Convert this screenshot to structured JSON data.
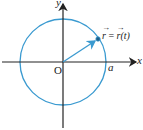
{
  "diagram": {
    "title": "",
    "axes": {
      "x_label": "x",
      "y_label": "y",
      "origin_label": "O"
    },
    "circle": {
      "radius_label": "a",
      "color": "#3a9ad0"
    },
    "vector": {
      "label": "r = r(t)",
      "label_lhs": "r",
      "label_eq": "=",
      "label_rhs": "r(t)",
      "color": "#3a9ad0"
    },
    "axis_color": "#222222"
  }
}
